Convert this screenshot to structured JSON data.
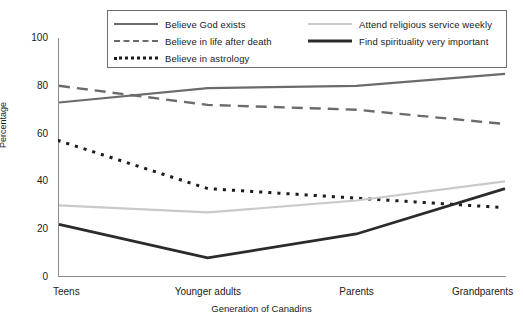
{
  "chart_data": {
    "type": "line",
    "title": "",
    "xlabel": "Generation of Canadins",
    "ylabel": "Percentage",
    "categories": [
      "Teens",
      "Younger adults",
      "Parents",
      "Grandparents"
    ],
    "ylim": [
      0,
      100
    ],
    "yticks": [
      "0",
      "20",
      "40",
      "60",
      "80",
      "100"
    ],
    "grid": false,
    "legend_position": "top",
    "series": [
      {
        "name": "Believe God exists",
        "values": [
          73,
          79,
          80,
          85
        ],
        "color": "#6b6b6b",
        "style": "solid",
        "width": 2.2
      },
      {
        "name": "Believe in life after death",
        "values": [
          80,
          72,
          70,
          64
        ],
        "color": "#6b6b6b",
        "style": "dashed",
        "width": 2.4
      },
      {
        "name": "Believe in astrology",
        "values": [
          57,
          37,
          33,
          29
        ],
        "color": "#1c1c1c",
        "style": "dotted",
        "width": 3.0
      },
      {
        "name": "Attend religious service weekly",
        "values": [
          30,
          27,
          32,
          40
        ],
        "color": "#c9c9c9",
        "style": "solid",
        "width": 2.2
      },
      {
        "name": "Find spirituality very important",
        "values": [
          22,
          8,
          18,
          37
        ],
        "color": "#2b2b2b",
        "style": "solid",
        "width": 2.8
      }
    ]
  },
  "legend": {
    "column1": [
      "Believe God exists",
      "Believe in life after death",
      "Believe in astrology"
    ],
    "column2": [
      "Attend religious service weekly",
      "Find spirituality very important"
    ]
  }
}
